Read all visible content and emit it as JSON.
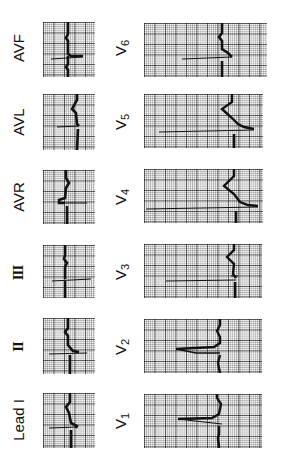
{
  "figure": {
    "orientation": "rotated -90deg",
    "trace_color": "#111111",
    "grid_color": "#555555"
  },
  "leads": {
    "limb": [
      {
        "id": "lead-i",
        "label": "Lead I",
        "sub": ""
      },
      {
        "id": "lead-ii",
        "label": "II",
        "sub": ""
      },
      {
        "id": "lead-iii",
        "label": "III",
        "sub": ""
      },
      {
        "id": "lead-avr",
        "label": "AVR",
        "sub": ""
      },
      {
        "id": "lead-avl",
        "label": "AVL",
        "sub": ""
      },
      {
        "id": "lead-avf",
        "label": "AVF",
        "sub": ""
      }
    ],
    "precordial": [
      {
        "id": "lead-v1",
        "label": "V",
        "sub": "1"
      },
      {
        "id": "lead-v2",
        "label": "V",
        "sub": "2"
      },
      {
        "id": "lead-v3",
        "label": "V",
        "sub": "3"
      },
      {
        "id": "lead-v4",
        "label": "V",
        "sub": "4"
      },
      {
        "id": "lead-v5",
        "label": "V",
        "sub": "5"
      },
      {
        "id": "lead-v6",
        "label": "V",
        "sub": "6"
      }
    ]
  }
}
